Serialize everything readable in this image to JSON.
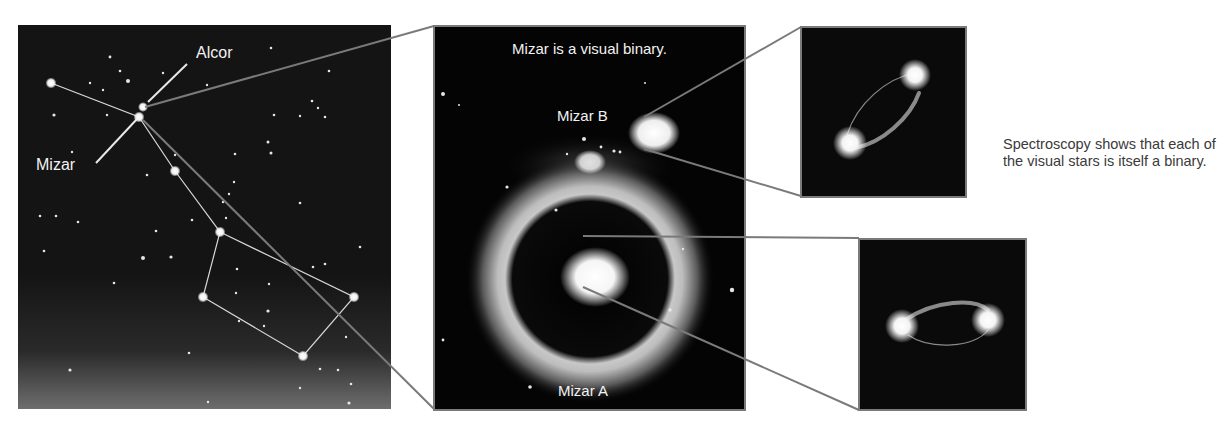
{
  "sky_chart": {
    "labels": {
      "alcor": "Alcor",
      "mizar": "Mizar"
    },
    "colors": {
      "background": "#141414",
      "stars": "#ffffff",
      "lines": "#d8d8d8"
    }
  },
  "telescope_view": {
    "title": "Mizar is a visual binary.",
    "labels": {
      "mizar_b": "Mizar B",
      "mizar_a": "Mizar A"
    }
  },
  "spectroscopic_views": {
    "mizar_b_binary": {
      "description": "spectroscopic binary orbit (Mizar B)"
    },
    "mizar_a_binary": {
      "description": "spectroscopic binary orbit (Mizar A)"
    }
  },
  "caption": "Spectroscopy shows that each of the visual stars is itself a binary.",
  "colors": {
    "connector": "#7a7a7a",
    "frame_border": "#7a7a7a",
    "caption_text": "#3a3a3a"
  }
}
